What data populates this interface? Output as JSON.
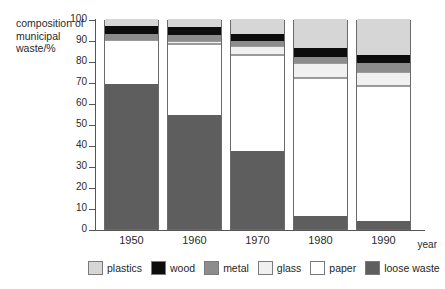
{
  "chart_data": {
    "type": "bar",
    "subtype": "stacked-bar",
    "title": "",
    "xlabel": "year",
    "ylabel": "composition of municipal waste/%",
    "categories": [
      "1950",
      "1960",
      "1970",
      "1980",
      "1990"
    ],
    "ylim": [
      0,
      100
    ],
    "ytick_labels": [
      "0",
      "10",
      "20",
      "30",
      "40",
      "50",
      "60",
      "70",
      "80",
      "90",
      "100"
    ],
    "ytick_values": [
      0,
      10,
      20,
      30,
      40,
      50,
      60,
      70,
      80,
      90,
      100
    ],
    "grid": false,
    "legend_position": "bottom",
    "stack_order_bottom_to_top": [
      "loose waste",
      "paper",
      "glass",
      "metal",
      "wood",
      "plastics"
    ],
    "series": [
      {
        "name": "loose waste",
        "color": "#5e5e5e",
        "values": [
          69,
          54.5,
          37,
          6,
          4
        ]
      },
      {
        "name": "paper",
        "color": "#ffffff",
        "values": [
          21,
          33.5,
          46,
          66,
          64
        ]
      },
      {
        "name": "glass",
        "color": "#f0f0f0",
        "values": [
          0,
          1.5,
          4,
          7,
          7
        ]
      },
      {
        "name": "metal",
        "color": "#8c8c8c",
        "values": [
          3,
          3,
          2.5,
          3,
          4
        ]
      },
      {
        "name": "wood",
        "color": "#0d0d0d",
        "values": [
          3.5,
          3.5,
          3.5,
          4,
          4
        ]
      },
      {
        "name": "plastics",
        "color": "#d6d6d6",
        "values": [
          3.5,
          4,
          7,
          14,
          17
        ]
      }
    ],
    "cumulative_tops": {
      "1950": {
        "loose waste": 69,
        "paper": 90,
        "glass": 90,
        "metal": 93,
        "wood": 96.5,
        "plastics": 100
      },
      "1960": {
        "loose waste": 54.5,
        "paper": 88,
        "glass": 89.5,
        "metal": 92.5,
        "wood": 96,
        "plastics": 100
      },
      "1970": {
        "loose waste": 37,
        "paper": 83,
        "glass": 87,
        "metal": 89.5,
        "wood": 93,
        "plastics": 100
      },
      "1980": {
        "loose waste": 6,
        "paper": 72,
        "glass": 79,
        "metal": 82,
        "wood": 86,
        "plastics": 100
      },
      "1990": {
        "loose waste": 4,
        "paper": 68,
        "glass": 75,
        "metal": 79,
        "wood": 83,
        "plastics": 100
      }
    }
  },
  "axis": {
    "y_title": "composition of municipal waste/%",
    "x_title": "year"
  },
  "legend": {
    "items": [
      {
        "label": "plastics",
        "color": "#d6d6d6"
      },
      {
        "label": "wood",
        "color": "#0d0d0d"
      },
      {
        "label": "metal",
        "color": "#8c8c8c"
      },
      {
        "label": "glass",
        "color": "#f0f0f0"
      },
      {
        "label": "paper",
        "color": "#ffffff"
      },
      {
        "label": "loose waste",
        "color": "#5e5e5e"
      }
    ]
  }
}
